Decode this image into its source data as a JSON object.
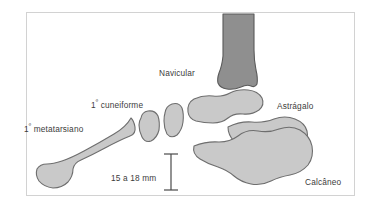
{
  "figure": {
    "language": "pt",
    "background_color": "#ffffff",
    "frame_color": "#d2d2d2",
    "bone_fill": "#c9c9c9",
    "bone_stroke": "#6e6e6e",
    "tibia_fill": "#8f8f8f",
    "tibia_stroke": "#5a5a5a",
    "text_color": "#3c3c3c"
  },
  "labels": {
    "metatarsal": {
      "ordinal": "1",
      "marker": "º",
      "text": " metatarsiano",
      "full": "1º metatarsiano"
    },
    "cuneiform": {
      "ordinal": "1",
      "marker": "º",
      "text": " cuneiforme",
      "full": "1º cuneiforme"
    },
    "navicular": {
      "full": "Navicular"
    },
    "talus": {
      "full": "Astrágalo"
    },
    "calcaneus": {
      "full": "Calcâneo"
    }
  },
  "measurement": {
    "value": "15 a 18 mm",
    "range_min": 15,
    "range_max": 18,
    "unit": "mm",
    "connector": "a",
    "orientation": "vertical",
    "cap_style": "double-ended-bar"
  },
  "bones": [
    {
      "name": "tibia",
      "label": null,
      "shade": "dark"
    },
    {
      "name": "navicular",
      "label": "Navicular",
      "shade": "light"
    },
    {
      "name": "talus",
      "label": "Astrágalo",
      "shade": "light"
    },
    {
      "name": "calcaneus",
      "label": "Calcâneo",
      "shade": "light"
    },
    {
      "name": "first-cuneiform",
      "label": "1º cuneiforme",
      "shade": "light"
    },
    {
      "name": "intermediate-bone",
      "label": null,
      "shade": "light"
    },
    {
      "name": "first-metatarsal",
      "label": "1º metatarsiano",
      "shade": "light"
    }
  ]
}
